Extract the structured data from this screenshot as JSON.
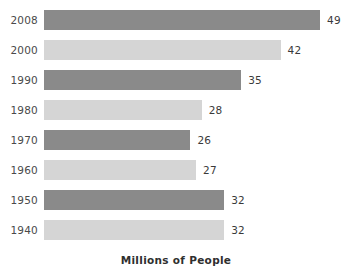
{
  "chart_data": {
    "type": "bar",
    "orientation": "horizontal",
    "title": "",
    "subtitle": "",
    "xlabel": "Millions of People",
    "ylabel": "",
    "categories": [
      "2008",
      "2000",
      "1990",
      "1980",
      "1970",
      "1960",
      "1950",
      "1940"
    ],
    "values": [
      49,
      42,
      35,
      28,
      26,
      27,
      32,
      32
    ],
    "value_labels": [
      "49",
      "42",
      "35",
      "28",
      "26",
      "27",
      "32",
      "32"
    ],
    "bar_colors": [
      "#8a8a8a",
      "#d5d5d5",
      "#8a8a8a",
      "#d5d5d5",
      "#8a8a8a",
      "#d5d5d5",
      "#8a8a8a",
      "#d5d5d5"
    ],
    "xlim": [
      0,
      49
    ],
    "ylim": null,
    "grid": false,
    "legend": null,
    "axis_line": false,
    "tick_labels_x": [],
    "tick_labels_y": [
      "2008",
      "2000",
      "1990",
      "1980",
      "1970",
      "1960",
      "1950",
      "1940"
    ],
    "annotations": [],
    "colors": {
      "dark_bar": "#8a8a8a",
      "light_bar": "#d5d5d5",
      "category_text": "#4a4a4a",
      "value_text": "#3a3a3a",
      "axis_title_text": "#2f2f2f",
      "background": "#ffffff"
    }
  },
  "axis": {
    "x_title": "Millions of People"
  }
}
